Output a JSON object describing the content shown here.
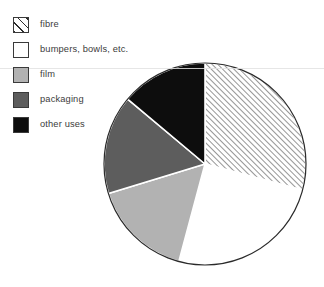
{
  "figure": {
    "kind": "pie-chart",
    "background": "#ffffff"
  },
  "legend": {
    "position": "top-left",
    "items": [
      {
        "label": "fibre",
        "swatch": "diagonal-hatch-swatch",
        "fill": "hatch",
        "color": "#ffffff"
      },
      {
        "label": "bumpers, bowls, etc.",
        "swatch": "white-swatch",
        "fill": "white",
        "color": "#ffffff"
      },
      {
        "label": "film",
        "swatch": "light-gray-swatch",
        "fill": "lgray",
        "color": "#b2b2b2"
      },
      {
        "label": "packaging",
        "swatch": "dark-gray-swatch",
        "fill": "dgray",
        "color": "#5d5d5d"
      },
      {
        "label": "other uses",
        "swatch": "black-swatch",
        "fill": "black",
        "color": "#0d0d0d"
      }
    ]
  },
  "pie": {
    "center_x": 205,
    "center_y": 164,
    "radius": 101,
    "outline_color": "#2a2a2a",
    "outline_width": 1.2,
    "start_angle_deg": 0,
    "direction": "clockwise"
  },
  "chart_data": {
    "type": "pie",
    "title": "",
    "subtitle": "",
    "xlabel": "",
    "ylabel": "",
    "grid": false,
    "legend_position": "top-left",
    "labels": [
      "fibre",
      "bumpers, bowls, etc.",
      "film",
      "packaging",
      "other uses"
    ],
    "values": [
      29,
      25,
      16,
      16,
      14
    ],
    "unit": "percent",
    "total": 100,
    "slices": [
      {
        "label": "fibre",
        "value": 29,
        "start_angle_deg": 0,
        "end_angle_deg": 105,
        "fill": "hatch",
        "color": "#ffffff",
        "pattern": "diagonal-hatch"
      },
      {
        "label": "bumpers, bowls, etc.",
        "value": 25,
        "start_angle_deg": 105,
        "end_angle_deg": 195,
        "fill": "white",
        "color": "#ffffff",
        "pattern": "solid"
      },
      {
        "label": "film",
        "value": 16,
        "start_angle_deg": 195,
        "end_angle_deg": 253,
        "fill": "lgray",
        "color": "#b2b2b2",
        "pattern": "solid"
      },
      {
        "label": "packaging",
        "value": 16,
        "start_angle_deg": 253,
        "end_angle_deg": 310,
        "fill": "dgray",
        "color": "#5d5d5d",
        "pattern": "solid"
      },
      {
        "label": "other uses",
        "value": 14,
        "start_angle_deg": 310,
        "end_angle_deg": 360,
        "fill": "black",
        "color": "#0d0d0d",
        "pattern": "solid"
      }
    ],
    "annotations": []
  }
}
